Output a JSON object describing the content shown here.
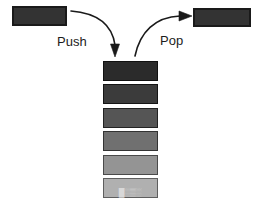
{
  "figure": {
    "width": 254,
    "height": 200,
    "background_color": "#ffffff"
  },
  "labels": {
    "push": "Push",
    "pop": "Pop",
    "text_color": "#1c1c1c"
  },
  "source_box": {
    "name": "incoming-element",
    "fill": "#333333",
    "stroke": "#1a1a1a"
  },
  "result_box": {
    "name": "outgoing-element",
    "fill": "#333333",
    "stroke": "#1a1a1a"
  },
  "stack": {
    "cell_count": 6,
    "cells": [
      {
        "index": 0,
        "position": "top",
        "fill": "#2b2b2b",
        "stroke": "#111111"
      },
      {
        "index": 1,
        "position": "2",
        "fill": "#3b3b3b",
        "stroke": "#151515"
      },
      {
        "index": 2,
        "position": "3",
        "fill": "#555555",
        "stroke": "#222222"
      },
      {
        "index": 3,
        "position": "4",
        "fill": "#707070",
        "stroke": "#333333"
      },
      {
        "index": 4,
        "position": "5",
        "fill": "#949494",
        "stroke": "#4a4a4a"
      },
      {
        "index": 5,
        "position": "bottom",
        "fill": "#b0b0b0",
        "stroke": "#5e5e5e"
      }
    ]
  },
  "arrows": {
    "push": {
      "name": "push-arrow",
      "direction": "down",
      "stroke": "#1a1a1a",
      "from": "source-box",
      "to": "stack-top"
    },
    "pop": {
      "name": "pop-arrow",
      "direction": "up-right",
      "stroke": "#1a1a1a",
      "from": "stack-top",
      "to": "result-box"
    }
  },
  "caption": {
    "fragment": "█░▒░"
  },
  "chart_data": {
    "type": "diagram",
    "nodes": [
      {
        "id": "source",
        "label": "",
        "shape": "rect",
        "color": "#333333"
      },
      {
        "id": "stack_top",
        "label": "",
        "shape": "rect",
        "color": "#2b2b2b"
      },
      {
        "id": "stack_2",
        "label": "",
        "shape": "rect",
        "color": "#3b3b3b"
      },
      {
        "id": "stack_3",
        "label": "",
        "shape": "rect",
        "color": "#555555"
      },
      {
        "id": "stack_4",
        "label": "",
        "shape": "rect",
        "color": "#707070"
      },
      {
        "id": "stack_5",
        "label": "",
        "shape": "rect",
        "color": "#949494"
      },
      {
        "id": "stack_bottom",
        "label": "",
        "shape": "rect",
        "color": "#b0b0b0"
      },
      {
        "id": "result",
        "label": "",
        "shape": "rect",
        "color": "#333333"
      }
    ],
    "edges": [
      {
        "from": "source",
        "to": "stack_top",
        "label": "Push",
        "style": "curved-arrow"
      },
      {
        "from": "stack_top",
        "to": "result",
        "label": "Pop",
        "style": "curved-arrow"
      }
    ]
  }
}
